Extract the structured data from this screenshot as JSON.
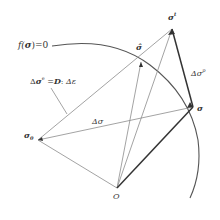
{
  "diagram": {
    "type": "stress-return-mapping",
    "labels": {
      "yield_surface": "f(σ) = 0",
      "elastic_increment": "Δσᵉ = D : Δε",
      "stress_increment": "Δσ",
      "plastic_increment": "Δσᵖ",
      "initial_stress": "σ₀",
      "origin": "O",
      "updated_stress": "σ",
      "trial_stress": "σᵗ",
      "intermediate_stress": "σ̂"
    },
    "label_parts": {
      "f": "f(",
      "sigma_bold": "σ",
      "close_eq": ")=0",
      "de_prefix": "Δ",
      "de_sigma": "σ",
      "de_sup": "e",
      "de_eq": " =",
      "de_D": "D",
      "de_colon": ":",
      "de_eps": " Δε",
      "ds": "Δσ",
      "dp": "Δσ",
      "dp_sup": "p",
      "s0": "σ",
      "s0_sub": "0",
      "O": "O",
      "s": "σ",
      "st": "σ",
      "st_sup": "t",
      "shat": "σ̂"
    },
    "colors": {
      "thin_line": "#8c8c8c",
      "bold_line": "#333333",
      "curve": "#555555",
      "text": "#333333"
    }
  }
}
